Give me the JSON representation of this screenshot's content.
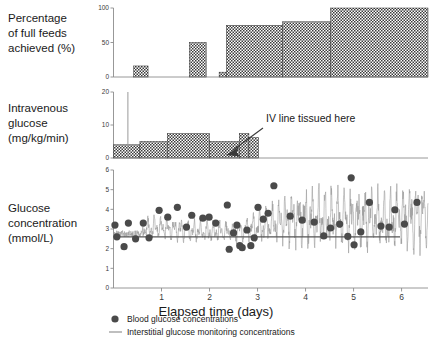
{
  "figure": {
    "xaxis_title": "Elapsed time (days)",
    "xtick_labels": [
      "1",
      "2",
      "3",
      "4",
      "5",
      "6"
    ],
    "xtick_values": [
      1,
      2,
      3,
      4,
      5,
      6
    ],
    "xlim": [
      0,
      6.55
    ],
    "annotation": "IV line tissued here",
    "colors": {
      "bar_fill": "#555555",
      "axis": "#8c8c8c",
      "dot": "#4a4a4a",
      "trace": "#9a9a9a",
      "refline": "#555555",
      "text": "#1a1a1a"
    }
  },
  "panel_feeds": {
    "label_lines": [
      "Percentage",
      "of full feeds",
      "achieved (%)"
    ],
    "ytick_labels": [
      "0",
      "50",
      "100"
    ],
    "chart_data": {
      "type": "bar",
      "title": "Percentage of full feeds achieved (%)",
      "xlabel": "Elapsed time (days)",
      "ylabel": "Percentage of full feeds achieved (%)",
      "ylim": [
        0,
        100
      ],
      "xlim": [
        0,
        6.55
      ],
      "grid": false,
      "legend": "none",
      "bars": [
        {
          "x_start": 0.0,
          "x_end": 0.42,
          "value": 0
        },
        {
          "x_start": 0.42,
          "x_end": 0.72,
          "value": 16
        },
        {
          "x_start": 0.72,
          "x_end": 1.58,
          "value": 0
        },
        {
          "x_start": 1.58,
          "x_end": 1.93,
          "value": 50
        },
        {
          "x_start": 1.93,
          "x_end": 2.2,
          "value": 0
        },
        {
          "x_start": 2.2,
          "x_end": 2.35,
          "value": 7
        },
        {
          "x_start": 2.35,
          "x_end": 3.52,
          "value": 75
        },
        {
          "x_start": 3.52,
          "x_end": 4.52,
          "value": 80
        },
        {
          "x_start": 4.52,
          "x_end": 6.55,
          "value": 100
        }
      ]
    }
  },
  "panel_iv": {
    "label_lines": [
      "Intravenous",
      "glucose",
      "(mg/kg/min)"
    ],
    "ytick_labels": [
      "0",
      "10",
      "20"
    ],
    "chart_data": {
      "type": "bar",
      "title": "Intravenous glucose (mg/kg/min)",
      "xlabel": "Elapsed time (days)",
      "ylabel": "Intravenous glucose (mg/kg/min)",
      "ylim": [
        0,
        20
      ],
      "xlim": [
        0,
        6.55
      ],
      "grid": false,
      "legend": "none",
      "spike": {
        "x": 0.3,
        "value": 20
      },
      "bars": [
        {
          "x_start": 0.0,
          "x_end": 0.55,
          "value": 4.0
        },
        {
          "x_start": 0.55,
          "x_end": 1.12,
          "value": 5.0
        },
        {
          "x_start": 1.12,
          "x_end": 2.0,
          "value": 7.4
        },
        {
          "x_start": 2.0,
          "x_end": 2.62,
          "value": 5.0
        },
        {
          "x_start": 2.62,
          "x_end": 2.82,
          "value": 7.4
        },
        {
          "x_start": 2.82,
          "x_end": 3.02,
          "value": 6.2
        },
        {
          "x_start": 3.02,
          "x_end": 6.55,
          "value": 0
        }
      ]
    }
  },
  "panel_glucose": {
    "label_lines": [
      "Glucose",
      "concentration",
      "(mmol/L)"
    ],
    "ytick_labels": [
      "0",
      "1",
      "2",
      "3",
      "4",
      "5",
      "6"
    ],
    "reference_line_value": 2.6,
    "chart_data": {
      "type": "scatter",
      "title": "Glucose concentration (mmol/L)",
      "xlabel": "Elapsed time (days)",
      "ylabel": "Glucose concentration (mmol/L)",
      "ylim": [
        0,
        6
      ],
      "xlim": [
        0,
        6.55
      ],
      "grid": false,
      "legend": "below-axis",
      "reference_line": {
        "value": 2.6,
        "label": "hypoglycaemia threshold"
      },
      "series": [
        {
          "name": "Blood glucose concentrations",
          "type": "scatter",
          "marker": "filled-circle",
          "points": [
            {
              "x": 0.03,
              "y": 3.2
            },
            {
              "x": 0.07,
              "y": 2.6
            },
            {
              "x": 0.22,
              "y": 2.1
            },
            {
              "x": 0.31,
              "y": 3.3
            },
            {
              "x": 0.46,
              "y": 2.5
            },
            {
              "x": 0.62,
              "y": 3.3
            },
            {
              "x": 0.74,
              "y": 2.55
            },
            {
              "x": 0.95,
              "y": 3.95
            },
            {
              "x": 1.13,
              "y": 3.6
            },
            {
              "x": 1.33,
              "y": 4.1
            },
            {
              "x": 1.52,
              "y": 3.1
            },
            {
              "x": 1.63,
              "y": 3.7
            },
            {
              "x": 1.86,
              "y": 3.55
            },
            {
              "x": 1.99,
              "y": 3.6
            },
            {
              "x": 2.13,
              "y": 3.3
            },
            {
              "x": 2.37,
              "y": 4.22
            },
            {
              "x": 2.41,
              "y": 1.97
            },
            {
              "x": 2.5,
              "y": 2.8
            },
            {
              "x": 2.57,
              "y": 3.2
            },
            {
              "x": 2.63,
              "y": 2.15
            },
            {
              "x": 2.68,
              "y": 2.05
            },
            {
              "x": 2.78,
              "y": 2.95
            },
            {
              "x": 2.86,
              "y": 2.15
            },
            {
              "x": 2.93,
              "y": 2.55
            },
            {
              "x": 3.01,
              "y": 4.1
            },
            {
              "x": 3.12,
              "y": 3.5
            },
            {
              "x": 3.22,
              "y": 3.8
            },
            {
              "x": 3.34,
              "y": 5.2
            },
            {
              "x": 3.68,
              "y": 3.65
            },
            {
              "x": 3.93,
              "y": 3.45
            },
            {
              "x": 4.18,
              "y": 3.35
            },
            {
              "x": 4.38,
              "y": 2.65
            },
            {
              "x": 4.52,
              "y": 3.05
            },
            {
              "x": 4.71,
              "y": 3.25
            },
            {
              "x": 4.88,
              "y": 2.62
            },
            {
              "x": 4.95,
              "y": 5.6
            },
            {
              "x": 5.01,
              "y": 2.2
            },
            {
              "x": 5.15,
              "y": 2.85
            },
            {
              "x": 5.33,
              "y": 4.35
            },
            {
              "x": 5.57,
              "y": 3.15
            },
            {
              "x": 5.74,
              "y": 3.1
            },
            {
              "x": 5.86,
              "y": 3.98
            },
            {
              "x": 6.06,
              "y": 3.25
            },
            {
              "x": 6.32,
              "y": 4.35
            }
          ]
        },
        {
          "name": "Interstitial glucose monitoring concentrations",
          "type": "line",
          "note": "high-frequency continuous trace oscillating approximately between 1.8 and 5.3 mmol/L, rising in amplitude and mean after day 3"
        }
      ]
    }
  },
  "legend": {
    "items": [
      {
        "marker": "filled-circle",
        "label": "Blood glucose concentrations"
      },
      {
        "marker": "line",
        "label": "Interstitial glucose monitoring concentrations"
      }
    ]
  }
}
